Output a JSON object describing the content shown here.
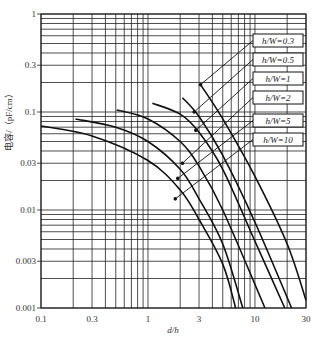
{
  "chart_data": {
    "type": "line",
    "title": "",
    "xlabel": "d/h",
    "ylabel": "电容/（pF/cm）",
    "xscale": "log",
    "yscale": "log",
    "xlim": [
      0.1,
      30
    ],
    "ylim": [
      0.001,
      1
    ],
    "grid": true,
    "legend_position": "right, boxed labels with leader lines",
    "x_ticks": [
      0.1,
      0.3,
      1,
      3,
      10,
      30
    ],
    "x_tick_labels": [
      "0.1",
      "0.3",
      "1",
      "3",
      "10",
      "30"
    ],
    "y_ticks": [
      0.001,
      0.003,
      0.01,
      0.03,
      0.1,
      0.3,
      1
    ],
    "y_tick_labels": [
      "0.001",
      "0.003",
      "0.01",
      "0.03",
      "0.1",
      "0.3",
      "1"
    ],
    "series": [
      {
        "name": "h/W=0.3",
        "x": [
          3.1,
          5,
          10,
          20,
          30
        ],
        "y": [
          0.19,
          0.085,
          0.022,
          0.0045,
          0.0012
        ]
      },
      {
        "name": "h/W=0.5",
        "x": [
          2.1,
          3,
          5,
          10,
          22
        ],
        "y": [
          0.14,
          0.09,
          0.036,
          0.0075,
          0.001
        ]
      },
      {
        "name": "h/W=1",
        "x": [
          1.1,
          2,
          3,
          5,
          10,
          19
        ],
        "y": [
          0.123,
          0.095,
          0.062,
          0.026,
          0.0048,
          0.001
        ]
      },
      {
        "name": "h/W=2",
        "x": [
          0.51,
          1,
          2,
          3,
          5,
          12.4
        ],
        "y": [
          0.105,
          0.085,
          0.05,
          0.028,
          0.01,
          0.001
        ]
      },
      {
        "name": "h/W=5",
        "x": [
          0.21,
          0.5,
          1,
          2,
          3,
          5,
          7.7
        ],
        "y": [
          0.085,
          0.07,
          0.05,
          0.026,
          0.013,
          0.0045,
          0.001
        ]
      },
      {
        "name": "h/W=10",
        "x": [
          0.1,
          0.3,
          1,
          2,
          3,
          5,
          6.6
        ],
        "y": [
          0.072,
          0.057,
          0.032,
          0.016,
          0.008,
          0.0028,
          0.001
        ]
      }
    ],
    "markers": [
      {
        "series": "h/W=0.3",
        "x": 3.1,
        "y": 0.19
      },
      {
        "series": "h/W=0.5",
        "x": 2.7,
        "y": 0.1
      },
      {
        "series": "h/W=1",
        "x": 2.8,
        "y": 0.065
      },
      {
        "series": "h/W=2",
        "x": 2.1,
        "y": 0.03
      },
      {
        "series": "h/W=5",
        "x": 1.9,
        "y": 0.021
      },
      {
        "series": "h/W=10",
        "x": 1.8,
        "y": 0.013
      }
    ]
  },
  "legend": {
    "items": [
      "h/W=0.3",
      "h/W=0.5",
      "h/W=1",
      "h/W=2",
      "h/W=5",
      "h/W=10"
    ]
  },
  "axes": {
    "xlabel": "d/h",
    "ylabel": "电容/（pF/cm）"
  }
}
